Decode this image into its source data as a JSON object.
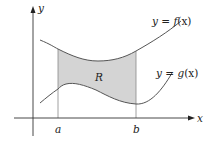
{
  "diagram": {
    "axes": {
      "x_label": "x",
      "y_label": "y"
    },
    "ticks": {
      "a_label": "a",
      "b_label": "b"
    },
    "curves": {
      "f_label_prefix": "y = ",
      "f_label_func": "f",
      "f_label_arg": "(x)",
      "g_label_prefix": "y = ",
      "g_label_func": "g",
      "g_label_arg": "(x)"
    },
    "region": {
      "label": "R",
      "fill_color": "#d4d4d4"
    },
    "colors": {
      "curve": "#555555",
      "axis": "#333333",
      "guide": "#888888"
    }
  }
}
